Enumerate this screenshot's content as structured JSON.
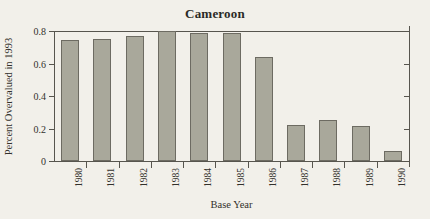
{
  "chart_data": {
    "type": "bar",
    "title": "Cameroon",
    "xlabel": "Base Year",
    "ylabel": "Percent Overvalued in 1993",
    "categories": [
      "1980",
      "1981",
      "1982",
      "1983",
      "1984",
      "1985",
      "1986",
      "1987",
      "1988",
      "1989",
      "1990"
    ],
    "values": [
      0.745,
      0.752,
      0.768,
      0.8,
      0.785,
      0.785,
      0.64,
      0.22,
      0.255,
      0.218,
      0.06
    ],
    "ylim": [
      0,
      0.8
    ],
    "yticks": [
      0,
      0.2,
      0.4,
      0.6,
      0.8
    ],
    "ytick_labels": [
      "0",
      "0.2",
      "0.4",
      "0.6",
      "0.8"
    ],
    "right_axis_ticks": [
      0.2,
      0.4,
      0.6
    ],
    "grid": false,
    "legend": null,
    "bar_color": "#a9a89b",
    "bar_edge_color": "#6d6b62",
    "axis_color": "#57554e",
    "background_color": "#f2f0ea"
  }
}
